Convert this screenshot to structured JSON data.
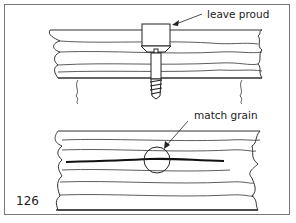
{
  "figure": {
    "number": "126",
    "top_panel": {
      "callout": "leave proud",
      "subject": "screw-with-plug-in-board"
    },
    "bottom_panel": {
      "callout": "match grain",
      "subject": "board-with-plug-circle-on-grain-line"
    }
  }
}
